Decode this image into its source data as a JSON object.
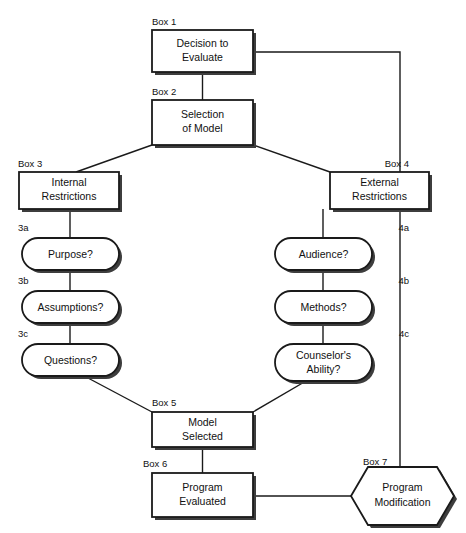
{
  "diagram": {
    "colors": {
      "stroke": "#1a1a1a",
      "fill": "#ffffff",
      "shadow": "#3d3d3d",
      "text": "#111111"
    },
    "nodes": [
      {
        "id": "box1",
        "tag": "Box 1",
        "shape": "rect",
        "lines": [
          "Decision to",
          "Evaluate"
        ]
      },
      {
        "id": "box2",
        "tag": "Box 2",
        "shape": "rect",
        "lines": [
          "Selection",
          "of Model"
        ]
      },
      {
        "id": "box3",
        "tag": "Box 3",
        "shape": "rect",
        "lines": [
          "Internal",
          "Restrictions"
        ]
      },
      {
        "id": "box4",
        "tag": "Box 4",
        "shape": "rect",
        "lines": [
          "External",
          "Restrictions"
        ]
      },
      {
        "id": "n3a",
        "tag": "3a",
        "shape": "stadium",
        "lines": [
          "Purpose?"
        ]
      },
      {
        "id": "n3b",
        "tag": "3b",
        "shape": "stadium",
        "lines": [
          "Assumptions?"
        ]
      },
      {
        "id": "n3c",
        "tag": "3c",
        "shape": "stadium",
        "lines": [
          "Questions?"
        ]
      },
      {
        "id": "n4a",
        "tag": "4a",
        "shape": "stadium",
        "lines": [
          "Audience?"
        ]
      },
      {
        "id": "n4b",
        "tag": "4b",
        "shape": "stadium",
        "lines": [
          "Methods?"
        ]
      },
      {
        "id": "n4c",
        "tag": "4c",
        "shape": "stadium",
        "lines": [
          "Counselor's",
          "Ability?"
        ]
      },
      {
        "id": "box5",
        "tag": "Box 5",
        "shape": "rect",
        "lines": [
          "Model",
          "Selected"
        ]
      },
      {
        "id": "box6",
        "tag": "Box 6",
        "shape": "rect",
        "lines": [
          "Program",
          "Evaluated"
        ]
      },
      {
        "id": "box7",
        "tag": "Box 7",
        "shape": "hexagon",
        "lines": [
          "Program",
          "Modification"
        ]
      }
    ],
    "edges": [
      {
        "from": "box1",
        "to": "box2",
        "kind": "vertical"
      },
      {
        "from": "box2",
        "to": "box3",
        "kind": "diagonal"
      },
      {
        "from": "box2",
        "to": "box4",
        "kind": "diagonal"
      },
      {
        "from": "box3",
        "to": "n3a",
        "kind": "vertical"
      },
      {
        "from": "n3a",
        "to": "n3b",
        "kind": "vertical"
      },
      {
        "from": "n3b",
        "to": "n3c",
        "kind": "vertical"
      },
      {
        "from": "box4",
        "to": "n4a",
        "kind": "vertical"
      },
      {
        "from": "n4a",
        "to": "n4b",
        "kind": "vertical"
      },
      {
        "from": "n4b",
        "to": "n4c",
        "kind": "vertical"
      },
      {
        "from": "n3c",
        "to": "box5",
        "kind": "diagonal"
      },
      {
        "from": "n4c",
        "to": "box5",
        "kind": "diagonal"
      },
      {
        "from": "box5",
        "to": "box6",
        "kind": "vertical"
      },
      {
        "from": "box6",
        "to": "box7",
        "kind": "horizontal"
      },
      {
        "from": "box7",
        "to": "box1",
        "kind": "feedback-elbow"
      }
    ]
  }
}
